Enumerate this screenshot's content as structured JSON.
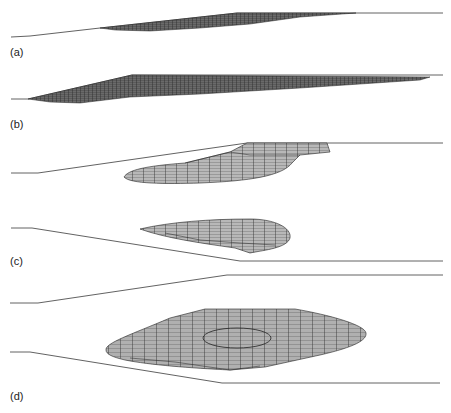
{
  "figure": {
    "panels": [
      {
        "id": "a",
        "label": "(a)",
        "description": "thin wedge-shaped mesh along sloped channel"
      },
      {
        "id": "b",
        "label": "(b)",
        "description": "elongated mesh filling sloped channel"
      },
      {
        "id": "c",
        "label": "(c)",
        "description": "two lobes of mesh below top boundary and above bottom boundary"
      },
      {
        "id": "d",
        "label": "(d)",
        "description": "broad lens-shaped mesh with inner elliptical contour between converging boundaries"
      }
    ],
    "colors": {
      "line": "#3a3a3a",
      "mesh_fill": "#b4b4b4",
      "mesh_dark": "#555555",
      "mesh_grid": "#1e1e1e"
    }
  }
}
